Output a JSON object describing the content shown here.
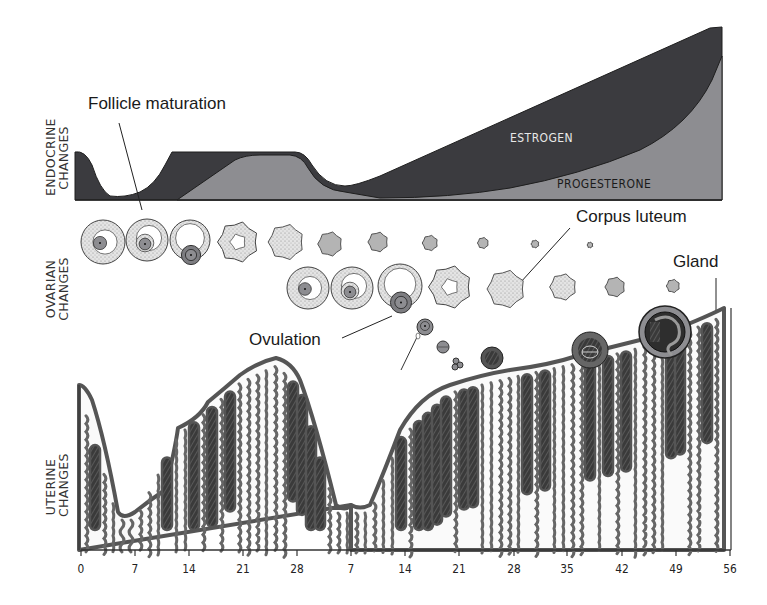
{
  "sections": {
    "endocrine": {
      "line1": "ENDOCRINE",
      "line2": "CHANGES"
    },
    "ovarian": {
      "line1": "OVARIAN",
      "line2": "CHANGES"
    },
    "uterine": {
      "line1": "UTERINE",
      "line2": "CHANGES"
    }
  },
  "hormones": {
    "estrogen_label": "ESTROGEN",
    "progesterone_label": "PROGESTERONE",
    "colors": {
      "estrogen": "#3b3b3f",
      "progesterone": "#8d8d91",
      "outline": "#222222"
    }
  },
  "annotations": {
    "follicle_maturation": "Follicle maturation",
    "corpus_luteum": "Corpus luteum",
    "ovulation": "Ovulation",
    "gland": "Gland"
  },
  "x_axis": {
    "ticks": [
      {
        "label": "0",
        "x": 81
      },
      {
        "label": "7",
        "x": 135
      },
      {
        "label": "14",
        "x": 189
      },
      {
        "label": "21",
        "x": 243
      },
      {
        "label": "28",
        "x": 297
      },
      {
        "label": "7",
        "x": 351
      },
      {
        "label": "14",
        "x": 405
      },
      {
        "label": "21",
        "x": 459
      },
      {
        "label": "28",
        "x": 514
      },
      {
        "label": "35",
        "x": 567
      },
      {
        "label": "42",
        "x": 622
      },
      {
        "label": "49",
        "x": 676
      },
      {
        "label": "56",
        "x": 730
      }
    ]
  },
  "ovary_row1": [
    {
      "type": "follicle",
      "x": 103,
      "y": 242,
      "r": 22
    },
    {
      "type": "follicle2",
      "x": 147,
      "y": 240,
      "r": 21
    },
    {
      "type": "follicle3",
      "x": 190,
      "y": 240,
      "r": 20
    },
    {
      "type": "ruptured",
      "x": 238,
      "y": 242,
      "r": 18
    },
    {
      "type": "cl",
      "x": 286,
      "y": 242,
      "r": 16
    },
    {
      "type": "cl",
      "x": 330,
      "y": 244,
      "r": 11
    },
    {
      "type": "cl",
      "x": 378,
      "y": 242,
      "r": 9
    },
    {
      "type": "cl",
      "x": 430,
      "y": 243,
      "r": 7
    },
    {
      "type": "cl",
      "x": 483,
      "y": 243,
      "r": 5
    },
    {
      "type": "cl",
      "x": 535,
      "y": 244,
      "r": 3.5
    },
    {
      "type": "cl",
      "x": 590,
      "y": 245,
      "r": 2.5
    }
  ],
  "ovary_row2": [
    {
      "type": "follicle",
      "x": 308,
      "y": 288,
      "r": 21
    },
    {
      "type": "follicle2",
      "x": 352,
      "y": 288,
      "r": 21
    },
    {
      "type": "follicle3",
      "x": 400,
      "y": 286,
      "r": 22
    },
    {
      "type": "ruptured",
      "x": 450,
      "y": 287,
      "r": 19
    },
    {
      "type": "cl",
      "x": 506,
      "y": 289,
      "r": 17
    },
    {
      "type": "cl",
      "x": 563,
      "y": 287,
      "r": 12
    },
    {
      "type": "cl",
      "x": 615,
      "y": 287,
      "r": 9
    },
    {
      "type": "cl",
      "x": 673,
      "y": 286,
      "r": 6
    }
  ]
}
